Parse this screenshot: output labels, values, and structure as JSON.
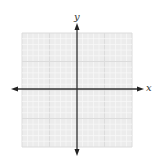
{
  "figure": {
    "type": "blank coordinate plane",
    "background_color": "#ffffff",
    "grid": {
      "visible": true,
      "divisions_x": 20,
      "divisions_y": 20,
      "major_every": 5,
      "fill_color": "#ececec",
      "minor_line_color": "#f7f7f7",
      "major_line_color": "#dcdcdc"
    },
    "axes": {
      "color": "#333333",
      "x_label": "x",
      "y_label": "y",
      "arrows": "both ends"
    }
  }
}
